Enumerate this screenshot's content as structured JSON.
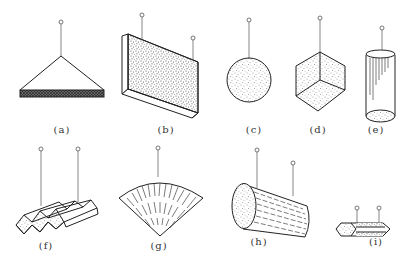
{
  "figure": {
    "stroke_color": "#222222",
    "fill_texture": "stippled",
    "panels": [
      {
        "id": "a",
        "label": "(a)",
        "shape": "flat plate hung by triangular bridle",
        "hangers": 1
      },
      {
        "id": "b",
        "label": "(b)",
        "shape": "rectangular slab",
        "hangers": 2
      },
      {
        "id": "c",
        "label": "(c)",
        "shape": "sphere",
        "hangers": 1
      },
      {
        "id": "d",
        "label": "(d)",
        "shape": "cube hung from corner",
        "hangers": 1
      },
      {
        "id": "e",
        "label": "(e)",
        "shape": "vertical cylinder",
        "hangers": 1
      },
      {
        "id": "f",
        "label": "(f)",
        "shape": "corrugated sheet",
        "hangers": 2
      },
      {
        "id": "g",
        "label": "(g)",
        "shape": "fan / sector",
        "hangers": 1
      },
      {
        "id": "h",
        "label": "(h)",
        "shape": "horizontal log cylinder",
        "hangers": 2
      },
      {
        "id": "i",
        "label": "(i)",
        "shape": "hexagonal prism",
        "hangers": 2
      }
    ]
  }
}
